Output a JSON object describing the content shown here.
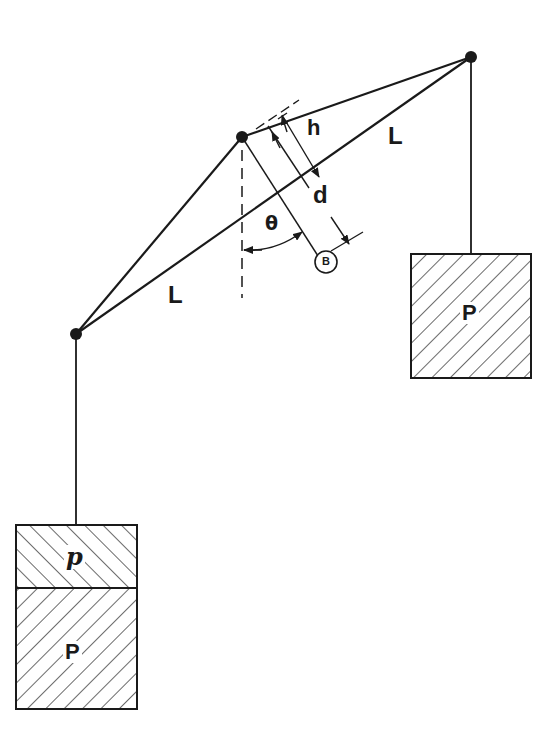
{
  "diagram": {
    "type": "mechanics-schematic",
    "colors": {
      "ink": "#1a1a1a",
      "background": "#ffffff"
    },
    "nodes": {
      "left": {
        "x": 76,
        "y": 334
      },
      "center": {
        "x": 242,
        "y": 137
      },
      "right": {
        "x": 471,
        "y": 57
      }
    },
    "labels": {
      "bar_left_length": "L",
      "bar_right_length": "L",
      "offset_h": "h",
      "offset_d": "d",
      "angle": "θ",
      "point_B": "B",
      "weight_right": "P",
      "weight_left": "P",
      "extra_weight": "p"
    },
    "weights": {
      "right": {
        "label": "P",
        "x": 411,
        "y": 254,
        "w": 120,
        "h": 124
      },
      "left_main": {
        "label": "P",
        "x": 16,
        "y": 588,
        "w": 121,
        "h": 121
      },
      "left_extra": {
        "label": "p",
        "x": 16,
        "y": 525,
        "w": 121,
        "h": 63
      }
    }
  }
}
